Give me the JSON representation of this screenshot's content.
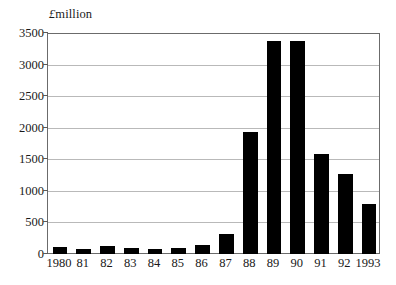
{
  "chart_data": {
    "type": "bar",
    "title": "",
    "ylabel": "£ million",
    "ylabel_currency_symbol": "£",
    "ylabel_word": "million",
    "xlabel": "",
    "categories": [
      "1980",
      "81",
      "82",
      "83",
      "84",
      "85",
      "86",
      "87",
      "88",
      "89",
      "90",
      "91",
      "92",
      "1993"
    ],
    "values": [
      110,
      80,
      125,
      95,
      80,
      95,
      150,
      310,
      1930,
      3370,
      3370,
      1580,
      1260,
      790
    ],
    "ylim": [
      0,
      3500
    ],
    "y_ticks": [
      0,
      500,
      1000,
      1500,
      2000,
      2500,
      3000,
      3500
    ],
    "y_tick_labels": [
      "0",
      "500",
      "1000",
      "1500",
      "2000",
      "2500",
      "3000",
      "3500"
    ],
    "grid": true,
    "grid_axis": "y",
    "legend": null,
    "bar_color": "#000000",
    "plot_background": "#ffffff",
    "frame_color": "#6b6b6b",
    "gridline_color": "#b9b9b9"
  }
}
